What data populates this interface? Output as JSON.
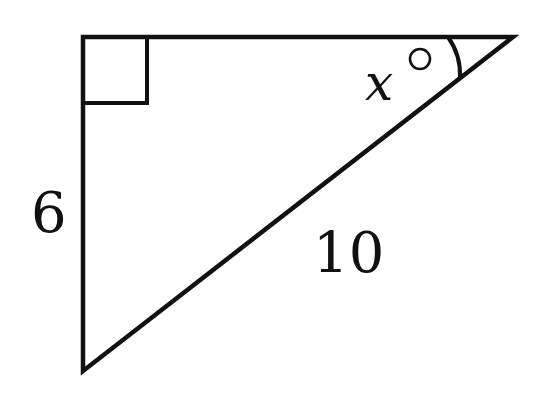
{
  "figure": {
    "type": "right-triangle",
    "vertices": {
      "right_angle": [
        83,
        37
      ],
      "top_right": [
        513,
        37
      ],
      "bottom": [
        83,
        371
      ]
    },
    "right_angle_marker": true,
    "labels": {
      "vertical_leg": "6",
      "hypotenuse": "10",
      "angle_var": "x",
      "angle_unit": "°"
    },
    "colors": {
      "stroke": "#111111",
      "background": "#ffffff"
    }
  }
}
